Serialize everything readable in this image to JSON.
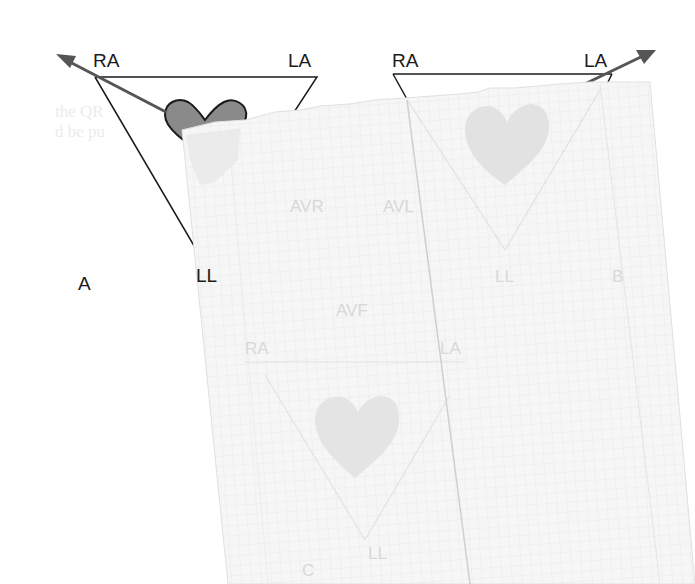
{
  "figure": {
    "panel_a": {
      "label": "A",
      "vertex_labels": {
        "right_arm": "RA",
        "left_arm": "LA",
        "left_leg": "LL"
      }
    },
    "panel_b": {
      "label": "B",
      "vertex_labels": {
        "right_arm": "RA",
        "left_arm": "LA",
        "left_leg": "LL"
      },
      "lead_labels": {
        "avl": "AVL"
      }
    },
    "panel_c": {
      "label": "C",
      "vertex_labels": {
        "right_arm": "RA",
        "left_arm": "LA",
        "left_leg": "LL"
      },
      "lead_labels": {
        "avr": "AVR",
        "avf": "AVF"
      }
    },
    "ghost_text": {
      "line1": "the QR",
      "line2": "d be pu"
    }
  },
  "colors": {
    "ink": "#1a1a1a",
    "heart_fill": "#8a8a8a",
    "arrow": "#555555",
    "overlay_paper": "#f4f4f4",
    "grid": "#e3e3e3",
    "faint_ink": "#d6d6d6"
  }
}
